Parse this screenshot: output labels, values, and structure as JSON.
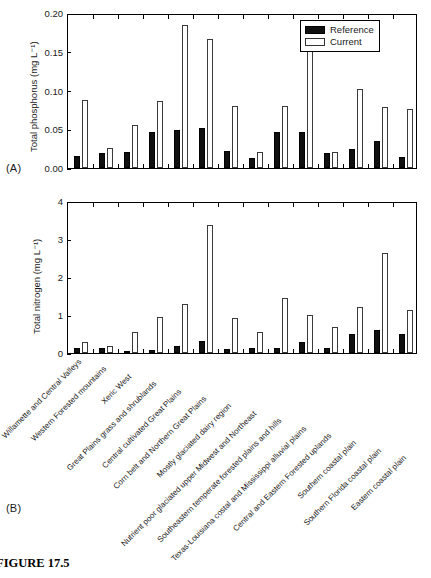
{
  "figure": {
    "caption": "FIGURE 17.5",
    "panel_a_tag": "(A)",
    "panel_b_tag": "(B)"
  },
  "legend": {
    "position": "top-right",
    "items": [
      {
        "label": "Reference",
        "style": "filled-black",
        "color": "#101010"
      },
      {
        "label": "Current",
        "style": "open-white",
        "color": "#ffffff"
      }
    ]
  },
  "categories": [
    "Willamette and Central Valleys",
    "Western Forested mountains",
    "Xeric West",
    "Great Plains grass and shrublands",
    "Central cultivated Great Plains",
    "Corn belt and Northern Great Plains",
    "Mostly glaciated dairy region",
    "Nutrient poor glaciated upper Midwest and Northeast",
    "Southeastern temperate forested plains and hills",
    "Texas-Louisiana costal and Mississippi alluvial plains",
    "Central and Eastern Forested uplands",
    "Southern coastal plain",
    "Southern Florida coastal plain",
    "Eastern coastal plain"
  ],
  "chart_data": [
    {
      "type": "bar",
      "panel": "A",
      "title": "",
      "xlabel": "",
      "ylabel": "Total phosphorus (mg L⁻¹)",
      "ylim": [
        0,
        0.2
      ],
      "yticks": [
        0,
        0.05,
        0.1,
        0.15,
        0.2
      ],
      "ytick_labels": [
        "0.00",
        "0.05",
        "0.10",
        "0.15",
        "0.20"
      ],
      "grid": false,
      "legend_position": "top-right",
      "categories": [
        "Willamette and Central Valleys",
        "Western Forested mountains",
        "Xeric West",
        "Great Plains grass and shrublands",
        "Central cultivated Great Plains",
        "Corn belt and Northern Great Plains",
        "Mostly glaciated dairy region",
        "Nutrient poor glaciated upper Midwest and Northeast",
        "Southeastern temperate forested plains and hills",
        "Texas-Louisiana costal and Mississippi alluvial plains",
        "Central and Eastern Forested uplands",
        "Southern coastal plain",
        "Southern Florida coastal plain",
        "Eastern coastal plain"
      ],
      "series": [
        {
          "name": "Reference",
          "values": [
            0.016,
            0.02,
            0.021,
            0.046,
            0.049,
            0.052,
            0.022,
            0.013,
            0.047,
            0.047,
            0.02,
            0.024,
            0.035,
            0.014
          ]
        },
        {
          "name": "Current",
          "values": [
            0.088,
            0.026,
            0.055,
            0.087,
            0.184,
            0.167,
            0.08,
            0.021,
            0.08,
            0.175,
            0.021,
            0.102,
            0.079,
            0.076
          ]
        }
      ]
    },
    {
      "type": "bar",
      "panel": "B",
      "title": "",
      "xlabel": "",
      "ylabel": "Total nitrogen (mg L⁻¹)",
      "ylim": [
        0,
        4
      ],
      "yticks": [
        0,
        1,
        2,
        3,
        4
      ],
      "ytick_labels": [
        "0",
        "1",
        "2",
        "3",
        "4"
      ],
      "grid": false,
      "legend_position": "none",
      "categories": [
        "Willamette and Central Valleys",
        "Western Forested mountains",
        "Xeric West",
        "Great Plains grass and shrublands",
        "Central cultivated Great Plains",
        "Corn belt and Northern Great Plains",
        "Mostly glaciated dairy region",
        "Nutrient poor glaciated upper Midwest and Northeast",
        "Southeastern temperate forested plains and hills",
        "Texas-Louisiana costal and Mississippi alluvial plains",
        "Central and Eastern Forested uplands",
        "Southern coastal plain",
        "Southern Florida coastal plain",
        "Eastern coastal plain"
      ],
      "series": [
        {
          "name": "Reference",
          "values": [
            0.13,
            0.12,
            0.03,
            0.09,
            0.18,
            0.31,
            0.1,
            0.12,
            0.12,
            0.3,
            0.14,
            0.5,
            0.61,
            0.5
          ]
        },
        {
          "name": "Current",
          "values": [
            0.28,
            0.19,
            0.55,
            0.95,
            1.28,
            3.37,
            0.93,
            0.55,
            1.45,
            1.0,
            0.68,
            1.21,
            2.64,
            1.12
          ]
        }
      ]
    }
  ]
}
